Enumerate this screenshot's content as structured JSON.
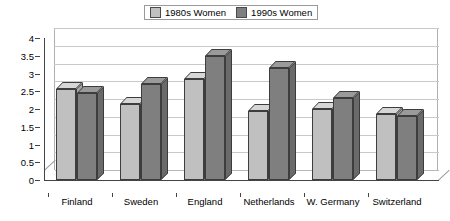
{
  "legend": {
    "position": "top-center",
    "items": [
      {
        "label": "1980s Women",
        "color": "#c0c0c0"
      },
      {
        "label": "1990s Women",
        "color": "#7f7f7f"
      }
    ]
  },
  "chart_data": {
    "type": "bar",
    "title": "",
    "xlabel": "",
    "ylabel": "",
    "ylim": [
      0,
      4
    ],
    "ytick_labels": [
      "4",
      "3.5",
      "3",
      "2.5",
      "2",
      "1.5",
      "1",
      "0.5",
      "0"
    ],
    "ytick_values": [
      4,
      3.5,
      3,
      2.5,
      2,
      1.5,
      1,
      0.5,
      0
    ],
    "grid": true,
    "three_d": true,
    "categories": [
      "Finland",
      "Sweden",
      "England",
      "Netherlands",
      "W. Germany",
      "Switzerland"
    ],
    "series": [
      {
        "name": "1980s Women",
        "color": "#c0c0c0",
        "values": [
          2.55,
          2.15,
          2.85,
          1.95,
          2.0,
          1.85
        ]
      },
      {
        "name": "1990s Women",
        "color": "#7f7f7f",
        "values": [
          2.45,
          2.7,
          3.5,
          3.15,
          2.3,
          1.8
        ]
      }
    ]
  }
}
